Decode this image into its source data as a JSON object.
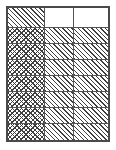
{
  "figure": {
    "kind": "hatched-grid-table",
    "caption": "",
    "border_color": "#4a4a4a",
    "gridline_color": "#555555",
    "hatch_color": "#3f3f3f",
    "background_color": "#ffffff"
  },
  "grid": {
    "column_count": 3,
    "row_count": 8,
    "column_widths_pct": [
      37,
      29,
      34
    ],
    "header_row_height_pct": 15,
    "body_row_height_pct": 12.14,
    "fill_legend": {
      "blank": "blank",
      "diagonal": "diagonal-hatch",
      "crosshatch": "cross-hatch"
    },
    "rows": [
      {
        "type": "header",
        "cells": [
          {
            "fill": "diagonal",
            "label": ""
          },
          {
            "fill": "blank",
            "label": ""
          },
          {
            "fill": "blank",
            "label": ""
          }
        ]
      },
      {
        "type": "body",
        "cells": [
          {
            "fill": "crosshatch",
            "label": ""
          },
          {
            "fill": "diagonal",
            "label": ""
          },
          {
            "fill": "diagonal",
            "label": ""
          }
        ]
      },
      {
        "type": "body",
        "cells": [
          {
            "fill": "crosshatch",
            "label": ""
          },
          {
            "fill": "diagonal",
            "label": ""
          },
          {
            "fill": "diagonal",
            "label": ""
          }
        ]
      },
      {
        "type": "body",
        "cells": [
          {
            "fill": "crosshatch",
            "label": ""
          },
          {
            "fill": "diagonal",
            "label": ""
          },
          {
            "fill": "diagonal",
            "label": ""
          }
        ]
      },
      {
        "type": "body",
        "cells": [
          {
            "fill": "crosshatch",
            "label": ""
          },
          {
            "fill": "diagonal",
            "label": ""
          },
          {
            "fill": "diagonal",
            "label": ""
          }
        ]
      },
      {
        "type": "body",
        "cells": [
          {
            "fill": "crosshatch",
            "label": ""
          },
          {
            "fill": "diagonal",
            "label": ""
          },
          {
            "fill": "diagonal",
            "label": ""
          }
        ]
      },
      {
        "type": "body",
        "cells": [
          {
            "fill": "crosshatch",
            "label": ""
          },
          {
            "fill": "diagonal",
            "label": ""
          },
          {
            "fill": "diagonal",
            "label": ""
          }
        ]
      },
      {
        "type": "body",
        "cells": [
          {
            "fill": "crosshatch",
            "label": ""
          },
          {
            "fill": "diagonal",
            "label": ""
          },
          {
            "fill": "diagonal",
            "label": ""
          }
        ]
      }
    ]
  }
}
